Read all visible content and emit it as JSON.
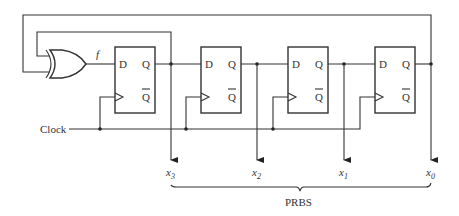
{
  "diagram": {
    "xor_output_label": "f",
    "clock_label": "Clock",
    "output_group_label": "PRBS",
    "flip_flops": [
      {
        "name": "ff-3",
        "d_label": "D",
        "q_label": "Q",
        "qbar_label": "Q"
      },
      {
        "name": "ff-2",
        "d_label": "D",
        "q_label": "Q",
        "qbar_label": "Q"
      },
      {
        "name": "ff-1",
        "d_label": "D",
        "q_label": "Q",
        "qbar_label": "Q"
      },
      {
        "name": "ff-0",
        "d_label": "D",
        "q_label": "Q",
        "qbar_label": "Q"
      }
    ],
    "outputs": [
      {
        "var": "x",
        "sub": "3"
      },
      {
        "var": "x",
        "sub": "2"
      },
      {
        "var": "x",
        "sub": "1"
      },
      {
        "var": "x",
        "sub": "0"
      }
    ]
  }
}
